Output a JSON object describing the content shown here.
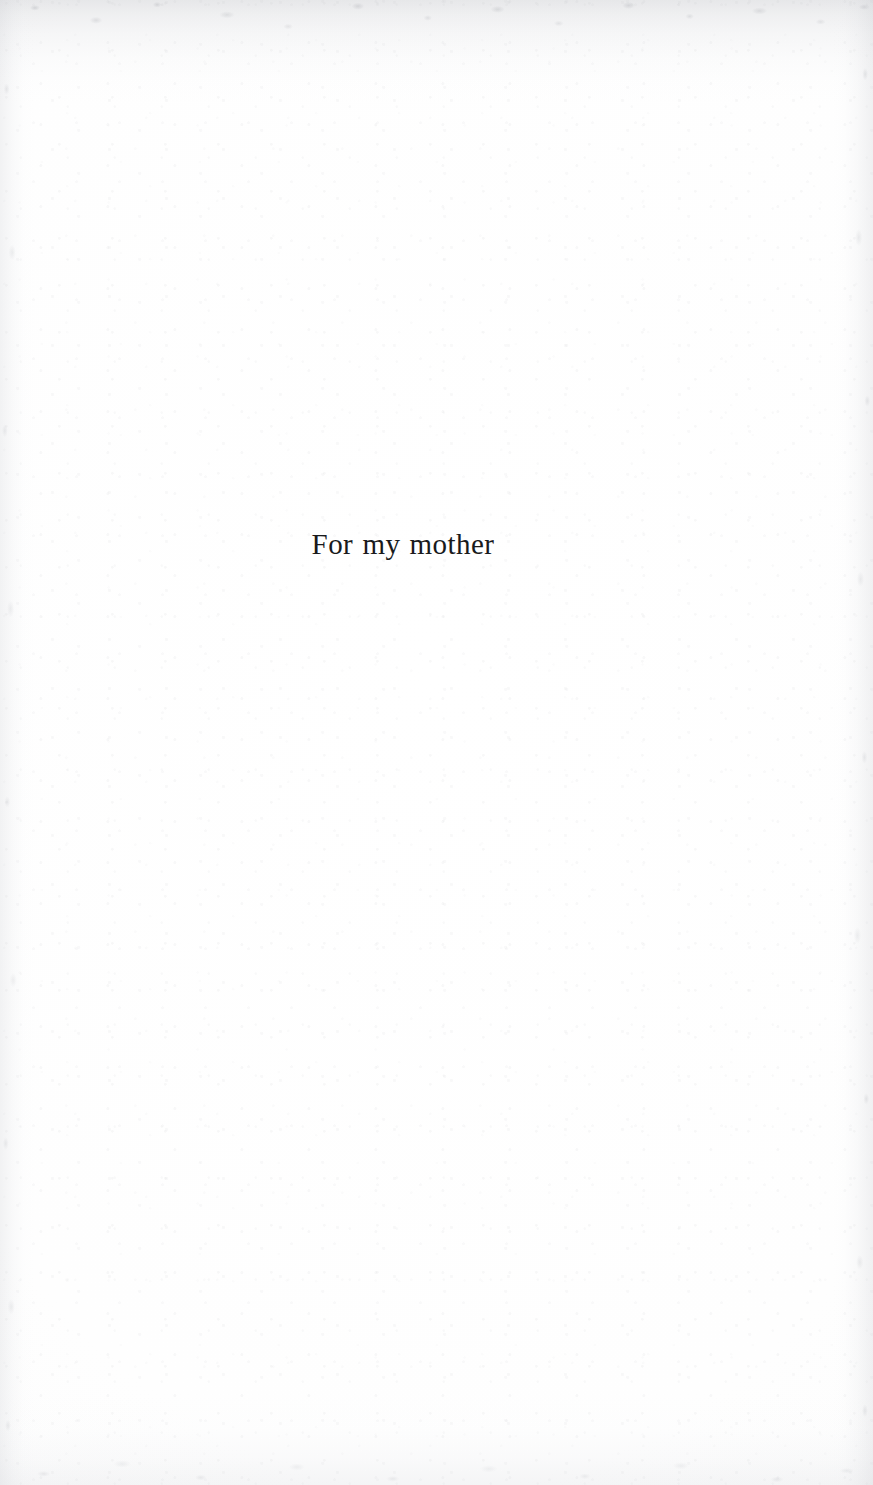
{
  "page": {
    "kind": "book-dedication-page",
    "width": 873,
    "height": 1485,
    "background_color": "#fefefe",
    "ink_color": "#191a1c"
  },
  "dedication": {
    "text": "For my mother"
  },
  "scan_artifacts": {
    "top_edge_tone": "#b0b2b8",
    "side_edge_tone": "#c4c6cc",
    "bottom_edge_tone": "#cdcfd5"
  }
}
